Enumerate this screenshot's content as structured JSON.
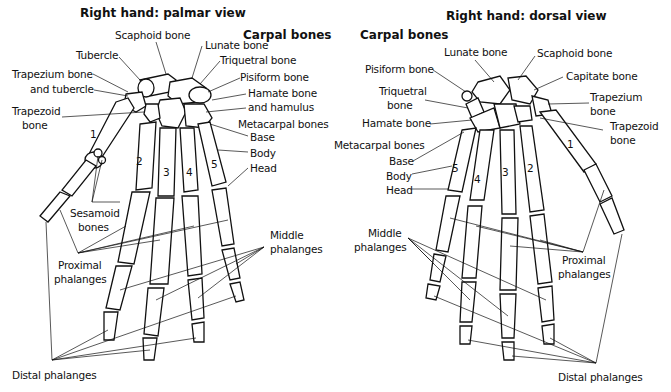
{
  "palmar": {
    "title": "Right hand: palmar view",
    "section": "Carpal bones",
    "labels": {
      "scaphoid": "Scaphoid bone",
      "tubercle": "Tubercle",
      "lunate": "Lunate bone",
      "triquetral": "Triquetral bone",
      "trapezium_1": "Trapezium bone",
      "trapezium_2": "and tubercle",
      "pisiform": "Pisiform bone",
      "hamate_1": "Hamate bone",
      "hamate_2": "and hamulus",
      "trapezoid_1": "Trapezoid",
      "trapezoid_2": "bone",
      "metacarpal": "Metacarpal bones",
      "base": "Base",
      "body": "Body",
      "head": "Head",
      "sesamoid_1": "Sesamoid",
      "sesamoid_2": "bones",
      "proximal_1": "Proximal",
      "proximal_2": "phalanges",
      "middle_1": "Middle",
      "middle_2": "phalanges",
      "distal": "Distal phalanges"
    },
    "digit_numbers": [
      "1",
      "2",
      "3",
      "4",
      "5"
    ]
  },
  "dorsal": {
    "title": "Right hand: dorsal view",
    "section": "Carpal bones",
    "labels": {
      "lunate": "Lunate bone",
      "scaphoid": "Scaphoid bone",
      "pisiform": "Pisiform bone",
      "capitate": "Capitate bone",
      "triquetral_1": "Triquetral",
      "triquetral_2": "bone",
      "trapezium_1": "Trapezium",
      "trapezium_2": "bone",
      "hamate": "Hamate bone",
      "trapezoid_1": "Trapezoid",
      "trapezoid_2": "bone",
      "metacarpal": "Metacarpal bones",
      "base": "Base",
      "body": "Body",
      "head": "Head",
      "middle_1": "Middle",
      "middle_2": "phalanges",
      "proximal_1": "Proximal",
      "proximal_2": "phalanges",
      "distal": "Distal phalanges"
    },
    "digit_numbers": [
      "1",
      "2",
      "3",
      "4",
      "5"
    ]
  }
}
